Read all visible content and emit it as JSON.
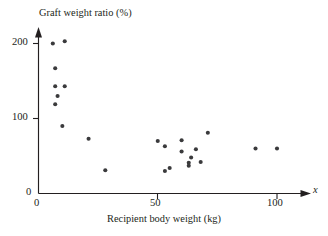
{
  "chart_data": {
    "type": "scatter",
    "title": "",
    "xlabel": "Recipient body weight (kg)",
    "ylabel": "Graft weight ratio (%)",
    "x_axis_variable": "x",
    "xlim": [
      0,
      118
    ],
    "ylim": [
      0,
      218
    ],
    "xticks": [
      0,
      50,
      100
    ],
    "xticklabels": [
      "0",
      "50",
      "100"
    ],
    "yticks": [
      0,
      100,
      200
    ],
    "yticklabels": [
      "0",
      "100",
      "200"
    ],
    "grid": false,
    "legend": false,
    "marker": "filled-circle",
    "marker_color": "#3a3a3c",
    "axis_color": "#231f20",
    "background_color": "#ffffff",
    "points": [
      {
        "x": 6,
        "y": 200
      },
      {
        "x": 11,
        "y": 203
      },
      {
        "x": 7,
        "y": 167
      },
      {
        "x": 7,
        "y": 143
      },
      {
        "x": 11,
        "y": 143
      },
      {
        "x": 8,
        "y": 130
      },
      {
        "x": 7,
        "y": 119
      },
      {
        "x": 10,
        "y": 90
      },
      {
        "x": 21,
        "y": 73
      },
      {
        "x": 28,
        "y": 31
      },
      {
        "x": 50,
        "y": 70
      },
      {
        "x": 53,
        "y": 63
      },
      {
        "x": 53,
        "y": 30
      },
      {
        "x": 55,
        "y": 34
      },
      {
        "x": 60,
        "y": 71
      },
      {
        "x": 60,
        "y": 56
      },
      {
        "x": 63,
        "y": 37
      },
      {
        "x": 63,
        "y": 41
      },
      {
        "x": 64,
        "y": 48
      },
      {
        "x": 66,
        "y": 59
      },
      {
        "x": 68,
        "y": 42
      },
      {
        "x": 71,
        "y": 81
      },
      {
        "x": 91,
        "y": 60
      },
      {
        "x": 100,
        "y": 60
      }
    ]
  },
  "labels": {
    "y_axis_title": "Graft weight ratio (%)",
    "x_axis_title": "Recipient body weight (kg)",
    "x_variable": "x",
    "y_tick_200": "200",
    "y_tick_100": "100",
    "y_tick_0": "0",
    "x_tick_0": "0",
    "x_tick_50": "50",
    "x_tick_100": "100"
  }
}
